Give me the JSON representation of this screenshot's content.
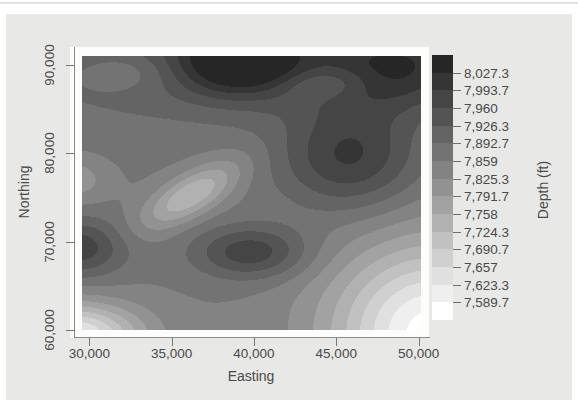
{
  "page": {
    "background": "#ffffff",
    "panel_background": "#e8e8e6"
  },
  "chart_data": {
    "type": "heatmap",
    "subtype": "filled-contour",
    "title": "",
    "xlabel": "Easting",
    "ylabel": "Northing",
    "x_ticks": [
      "30,000",
      "35,000",
      "40,000",
      "45,000",
      "50,000"
    ],
    "x_tick_values": [
      30000,
      35000,
      40000,
      45000,
      50000
    ],
    "y_ticks": [
      "60,000",
      "70,000",
      "80,000",
      "90,000"
    ],
    "y_tick_values": [
      60000,
      70000,
      80000,
      90000
    ],
    "x_domain": [
      29550,
      50150
    ],
    "y_domain": [
      60000,
      91000
    ],
    "grid": false,
    "legend": {
      "title": "Depth (ft)",
      "position": "right",
      "labels_top_to_bottom": [
        "8,027.3",
        "7,993.7",
        "7,960",
        "7,926.3",
        "7,892.7",
        "7,859",
        "7,825.3",
        "7,791.7",
        "7,758",
        "7,724.3",
        "7,690.7",
        "7,657",
        "7,623.3",
        "7,589.7"
      ],
      "thresholds_ascending": [
        7589.7,
        7623.3,
        7657,
        7690.7,
        7724.3,
        7758,
        7791.7,
        7825.3,
        7859,
        7892.7,
        7926.3,
        7960,
        7993.7,
        8027.3
      ],
      "band_colors_low_to_high": [
        "#ffffff",
        "#efefef",
        "#e0e0e0",
        "#d0d0d0",
        "#c1c1c1",
        "#b1b1b1",
        "#a2a2a2",
        "#929292",
        "#838383",
        "#737373",
        "#646464",
        "#545454",
        "#454545",
        "#353535",
        "#262626"
      ]
    },
    "surface_model": {
      "comment": "Depth(E,N) = base + sum of gaussian features; amp in ft, sigma in coordinate units, angle deg",
      "base": 7860,
      "features": [
        {
          "name": "peak-top-center",
          "x": 39200,
          "y": 90500,
          "amp": 190,
          "sx": 2600,
          "sy": 2800,
          "angle": 0
        },
        {
          "name": "peak-top-right",
          "x": 48800,
          "y": 89800,
          "amp": 150,
          "sx": 3600,
          "sy": 3600,
          "angle": 0
        },
        {
          "name": "ridge-right",
          "x": 45800,
          "y": 79500,
          "amp": 135,
          "sx": 3000,
          "sy": 4200,
          "angle": 0
        },
        {
          "name": "peak-center-bottom",
          "x": 39800,
          "y": 68800,
          "amp": 125,
          "sx": 2400,
          "sy": 2100,
          "angle": 0
        },
        {
          "name": "peak-left-edge",
          "x": 29200,
          "y": 69300,
          "amp": 125,
          "sx": 2100,
          "sy": 2300,
          "angle": 0
        },
        {
          "name": "ridge-top-broad",
          "x": 36000,
          "y": 91500,
          "amp": 80,
          "sx": 8500,
          "sy": 5500,
          "angle": 0
        },
        {
          "name": "valley-ellipse",
          "x": 36200,
          "y": 75300,
          "amp": -135,
          "sx": 3100,
          "sy": 1250,
          "angle": 55
        },
        {
          "name": "valley-left-small",
          "x": 29100,
          "y": 77000,
          "amp": -60,
          "sx": 1300,
          "sy": 1700,
          "angle": 0
        },
        {
          "name": "basin-bottom-right",
          "x": 50900,
          "y": 59600,
          "amp": -290,
          "sx": 4300,
          "sy": 7000,
          "angle": 0
        },
        {
          "name": "basin-bottom-left",
          "x": 28900,
          "y": 59400,
          "amp": -250,
          "sx": 2900,
          "sy": 2500,
          "angle": 0
        },
        {
          "name": "dimple-top-right",
          "x": 44300,
          "y": 87900,
          "amp": -55,
          "sx": 1900,
          "sy": 1200,
          "angle": 10
        },
        {
          "name": "dimple-top-left",
          "x": 32200,
          "y": 89200,
          "amp": -50,
          "sx": 2100,
          "sy": 1600,
          "angle": 0
        }
      ]
    }
  }
}
